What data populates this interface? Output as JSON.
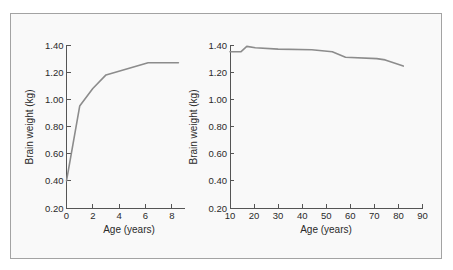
{
  "colors": {
    "line": "#8c8c8c",
    "axis": "#555555",
    "frame": "#a3a3a3",
    "panel_bg": "#f9f9f9"
  },
  "chart_data": [
    {
      "type": "line",
      "title": "",
      "xlabel": "Age (years)",
      "ylabel": "Brain weight (kg)",
      "xlim": [
        0,
        9
      ],
      "ylim": [
        0.2,
        1.4
      ],
      "xticks": [
        0,
        2,
        4,
        6,
        8
      ],
      "xtick_labels": [
        "0",
        "2",
        "4",
        "6",
        "8"
      ],
      "yticks": [
        0.2,
        0.4,
        0.6,
        0.8,
        1.0,
        1.2,
        1.4
      ],
      "ytick_labels": [
        "0.20",
        "0.40",
        "0.60",
        "0.80",
        "1.00",
        "1.20",
        "1.40"
      ],
      "grid": false,
      "legend": null,
      "series": [
        {
          "name": "Brain weight",
          "x": [
            0,
            1,
            2,
            3,
            6.2,
            8.5
          ],
          "y": [
            0.4,
            0.95,
            1.08,
            1.18,
            1.27,
            1.27
          ]
        }
      ]
    },
    {
      "type": "line",
      "title": "",
      "xlabel": "Age (years)",
      "ylabel": "Brain weight (kg)",
      "xlim": [
        10,
        90
      ],
      "ylim": [
        0.2,
        1.4
      ],
      "xticks": [
        10,
        20,
        30,
        40,
        50,
        60,
        70,
        80,
        90
      ],
      "xtick_labels": [
        "10",
        "20",
        "30",
        "40",
        "50",
        "60",
        "70",
        "80",
        "90"
      ],
      "yticks": [
        0.2,
        0.4,
        0.6,
        0.8,
        1.0,
        1.2,
        1.4
      ],
      "ytick_labels": [
        "0.20",
        "0.40",
        "0.60",
        "0.80",
        "1.00",
        "1.20",
        "1.40"
      ],
      "grid": false,
      "legend": null,
      "series": [
        {
          "name": "Brain weight",
          "x": [
            10,
            14.5,
            17,
            20.5,
            30,
            44,
            52.5,
            58,
            71,
            74.5,
            82
          ],
          "y": [
            1.35,
            1.35,
            1.39,
            1.38,
            1.37,
            1.365,
            1.35,
            1.31,
            1.3,
            1.29,
            1.245
          ]
        }
      ]
    }
  ]
}
